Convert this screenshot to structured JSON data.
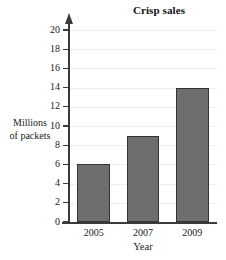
{
  "chart_data": {
    "type": "bar",
    "title": "Crisp sales",
    "xlabel": "Year",
    "ylabel": "Millions of packets",
    "ylabel_lines": [
      "Millions",
      "of packets"
    ],
    "categories": [
      "2005",
      "2007",
      "2009"
    ],
    "values": [
      6,
      9,
      14
    ],
    "series": [
      {
        "name": "Crisp sales",
        "values": [
          6,
          9,
          14
        ]
      }
    ],
    "ylim": [
      0,
      20
    ],
    "y_tick_step": 2,
    "y_ticks": [
      0,
      2,
      4,
      6,
      8,
      10,
      12,
      14,
      16,
      18,
      20
    ],
    "y_tick_labels": [
      "0",
      "2",
      "4",
      "6",
      "8",
      "10",
      "12",
      "14",
      "16",
      "18",
      "20"
    ],
    "grid": true,
    "legend": false,
    "legend_position": "none",
    "bar_fill_color": "#6e6e6e",
    "bar_border_color": "#333333",
    "gridline_color": "#ededed",
    "axis_color": "#3a3a3a",
    "background_color": "#ffffff",
    "y_axis_arrow": true
  }
}
